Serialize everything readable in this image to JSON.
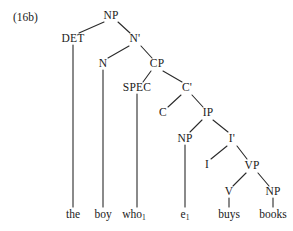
{
  "figure": {
    "example_number": "(16b)",
    "type": "syntax-tree"
  },
  "tree": {
    "nodes": [
      {
        "id": "NP",
        "label": "NP",
        "x": 111,
        "y": 16
      },
      {
        "id": "DET",
        "label": "DET",
        "x": 73,
        "y": 39
      },
      {
        "id": "Nbar",
        "label": "N'",
        "x": 135,
        "y": 39
      },
      {
        "id": "N",
        "label": "N",
        "x": 103,
        "y": 64
      },
      {
        "id": "CP",
        "label": "CP",
        "x": 157,
        "y": 64
      },
      {
        "id": "SPEC",
        "label": "SPEC",
        "x": 137,
        "y": 88
      },
      {
        "id": "Cbar",
        "label": "C'",
        "x": 187,
        "y": 88
      },
      {
        "id": "C",
        "label": "C",
        "x": 163,
        "y": 113
      },
      {
        "id": "IP",
        "label": "IP",
        "x": 208,
        "y": 113
      },
      {
        "id": "NP2",
        "label": "NP",
        "x": 185,
        "y": 139
      },
      {
        "id": "Ibar",
        "label": "I'",
        "x": 232,
        "y": 139
      },
      {
        "id": "I",
        "label": "I",
        "x": 207,
        "y": 165
      },
      {
        "id": "VP",
        "label": "VP",
        "x": 252,
        "y": 166
      },
      {
        "id": "V",
        "label": "V",
        "x": 229,
        "y": 192
      },
      {
        "id": "NP3",
        "label": "NP",
        "x": 273,
        "y": 192
      }
    ],
    "terminals": [
      {
        "id": "the",
        "text": "the",
        "sub": "",
        "x": 73,
        "y": 215
      },
      {
        "id": "boy",
        "text": "boy",
        "sub": "",
        "x": 103,
        "y": 215
      },
      {
        "id": "who",
        "text": "who",
        "sub": "1",
        "x": 134,
        "y": 215
      },
      {
        "id": "e",
        "text": "e",
        "sub": "1",
        "x": 185,
        "y": 215
      },
      {
        "id": "buys",
        "text": "buys",
        "sub": "",
        "x": 229,
        "y": 215
      },
      {
        "id": "books",
        "text": "books",
        "sub": "",
        "x": 273,
        "y": 215
      }
    ],
    "branches": [
      {
        "from": "NP",
        "to": "DET",
        "x1": 104,
        "y1": 22,
        "x2": 79,
        "y2": 33
      },
      {
        "from": "NP",
        "to": "Nbar",
        "x1": 118,
        "y1": 22,
        "x2": 130,
        "y2": 33
      },
      {
        "from": "Nbar",
        "to": "N",
        "x1": 129,
        "y1": 46,
        "x2": 108,
        "y2": 58
      },
      {
        "from": "Nbar",
        "to": "CP",
        "x1": 141,
        "y1": 46,
        "x2": 152,
        "y2": 58
      },
      {
        "from": "CP",
        "to": "SPEC",
        "x1": 151,
        "y1": 71,
        "x2": 143,
        "y2": 82
      },
      {
        "from": "CP",
        "to": "Cbar",
        "x1": 163,
        "y1": 71,
        "x2": 182,
        "y2": 82
      },
      {
        "from": "Cbar",
        "to": "C",
        "x1": 181,
        "y1": 95,
        "x2": 168,
        "y2": 107
      },
      {
        "from": "Cbar",
        "to": "IP",
        "x1": 192,
        "y1": 95,
        "x2": 203,
        "y2": 107
      },
      {
        "from": "IP",
        "to": "NP2",
        "x1": 202,
        "y1": 120,
        "x2": 190,
        "y2": 132
      },
      {
        "from": "IP",
        "to": "Ibar",
        "x1": 213,
        "y1": 120,
        "x2": 228,
        "y2": 132
      },
      {
        "from": "Ibar",
        "to": "I",
        "x1": 227,
        "y1": 146,
        "x2": 211,
        "y2": 159
      },
      {
        "from": "Ibar",
        "to": "VP",
        "x1": 237,
        "y1": 146,
        "x2": 247,
        "y2": 159
      },
      {
        "from": "VP",
        "to": "V",
        "x1": 246,
        "y1": 173,
        "x2": 233,
        "y2": 186
      },
      {
        "from": "VP",
        "to": "NP3",
        "x1": 258,
        "y1": 173,
        "x2": 269,
        "y2": 186
      }
    ],
    "stems": [
      {
        "from": "DET",
        "to": "the",
        "x": 73,
        "y1": 45,
        "y2": 207
      },
      {
        "from": "N",
        "to": "boy",
        "x": 103,
        "y1": 70,
        "y2": 207
      },
      {
        "from": "SPEC",
        "to": "who",
        "x": 137,
        "y1": 94,
        "y2": 207
      },
      {
        "from": "NP2",
        "to": "e",
        "x": 185,
        "y1": 145,
        "y2": 207
      },
      {
        "from": "V",
        "to": "buys",
        "x": 229,
        "y1": 198,
        "y2": 207
      },
      {
        "from": "NP3",
        "to": "books",
        "x": 273,
        "y1": 198,
        "y2": 207
      }
    ]
  },
  "style": {
    "line_color": "#2a2a2a",
    "text_color": "#1a1a1a",
    "background": "#ffffff"
  }
}
